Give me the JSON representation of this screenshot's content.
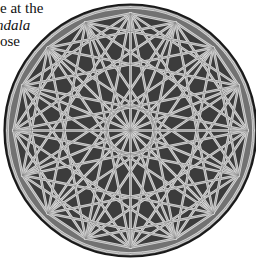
{
  "text_fragment": {
    "lines": [
      {
        "text": "e at the",
        "italic": false
      },
      {
        "text": "ndala",
        "italic": true
      },
      {
        "text": "ose",
        "italic": false
      }
    ]
  },
  "figure": {
    "type": "mandala",
    "center": [
      130.5,
      130.5
    ],
    "outer_radius": 126,
    "vertex_radius": 117,
    "inner_ring_radius": 25,
    "points": 16,
    "star_steps": [
      3,
      5,
      7
    ],
    "colors": {
      "outline": "#1a1a1a",
      "outer_band": "#727272",
      "inner_fill": "#3c3c3c",
      "line": "#d6d6d6",
      "line_core": "#8a8a8a"
    }
  }
}
